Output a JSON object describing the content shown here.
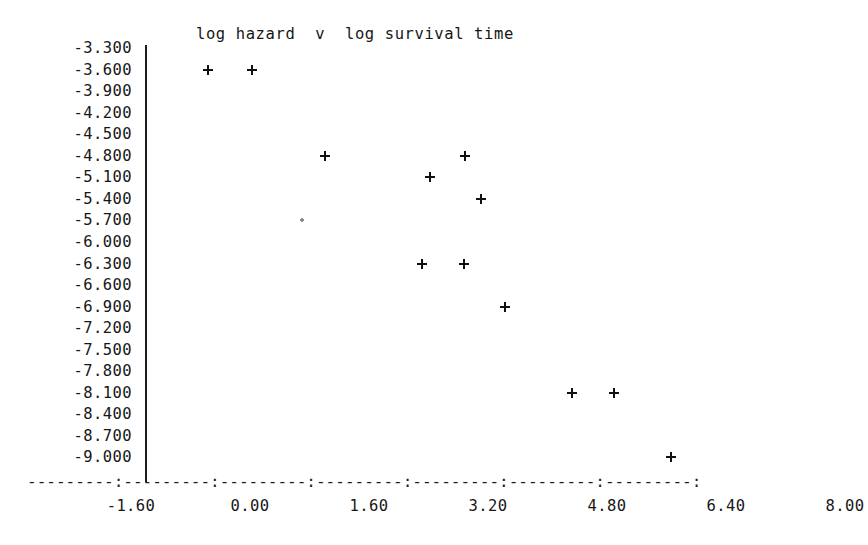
{
  "chart_data": {
    "type": "scatter",
    "title": "log hazard  v  log survival time",
    "xlabel": "",
    "ylabel": "",
    "xlim": [
      -2.4,
      8.0
    ],
    "ylim": [
      -9.15,
      -3.15
    ],
    "grid": false,
    "legend": null,
    "marker": "+",
    "x_ticks": [
      -1.6,
      0.0,
      1.6,
      3.2,
      4.8,
      6.4,
      8.0
    ],
    "x_tick_labels": [
      "-1.60",
      "0.00",
      "1.60",
      "3.20",
      "4.80",
      "6.40",
      "8.00"
    ],
    "y_ticks": [
      -3.3,
      -3.6,
      -3.9,
      -4.2,
      -4.5,
      -4.8,
      -5.1,
      -5.4,
      -5.7,
      -6.0,
      -6.3,
      -6.6,
      -6.9,
      -7.2,
      -7.5,
      -7.8,
      -8.1,
      -8.4,
      -8.7,
      -9.0
    ],
    "y_tick_labels": [
      "-3.300",
      "-3.600",
      "-3.900",
      "-4.200",
      "-4.500",
      "-4.800",
      "-5.100",
      "-5.400",
      "-5.700",
      "-6.000",
      "-6.300",
      "-6.600",
      "-6.900",
      "-7.200",
      "-7.500",
      "-7.800",
      "-8.100",
      "-8.400",
      "-8.700",
      "-9.000"
    ],
    "points": [
      {
        "x": -0.56,
        "y": -3.6,
        "faint": false
      },
      {
        "x": 0.03,
        "y": -3.6,
        "faint": false
      },
      {
        "x": 1.01,
        "y": -4.8,
        "faint": false
      },
      {
        "x": 2.89,
        "y": -4.8,
        "faint": false
      },
      {
        "x": 2.42,
        "y": -5.1,
        "faint": false
      },
      {
        "x": 3.1,
        "y": -5.4,
        "faint": false
      },
      {
        "x": 0.7,
        "y": -5.7,
        "faint": true
      },
      {
        "x": 2.31,
        "y": -6.3,
        "faint": false
      },
      {
        "x": 2.88,
        "y": -6.3,
        "faint": false
      },
      {
        "x": 3.43,
        "y": -6.9,
        "faint": false
      },
      {
        "x": 4.33,
        "y": -8.1,
        "faint": false
      },
      {
        "x": 4.9,
        "y": -8.1,
        "faint": false
      },
      {
        "x": 5.66,
        "y": -9.0,
        "faint": false
      }
    ]
  },
  "axis": {
    "x_axis_glyphs": "---------:---------:---------:---------:---------:---------:---------:"
  },
  "colors": {
    "ink": "#171717",
    "axis": "#1c1c1c",
    "background": "#ffffff",
    "faint_marker": "#8c8c8c"
  }
}
